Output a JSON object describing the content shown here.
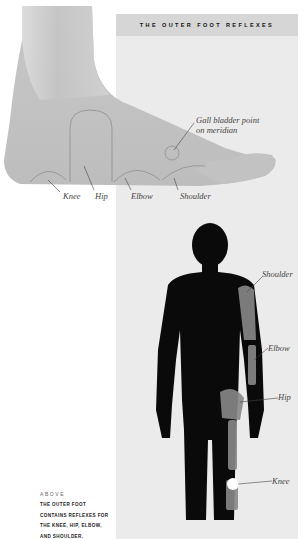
{
  "header": {
    "title": "THE OUTER FOOT REFLEXES"
  },
  "foot_labels": {
    "gall_bladder_line1": "Gall bladder point",
    "gall_bladder_line2": "on meridian",
    "knee": "Knee",
    "hip": "Hip",
    "elbow": "Elbow",
    "shoulder": "Shoulder"
  },
  "body_labels": {
    "shoulder": "Shoulder",
    "elbow": "Elbow",
    "hip": "Hip",
    "knee": "Knee"
  },
  "caption": {
    "kicker": "ABOVE",
    "lines": [
      "THE OUTER FOOT",
      "CONTAINS REFLEXES FOR",
      "THE KNEE, HIP, ELBOW,",
      "AND SHOULDER."
    ]
  },
  "colors": {
    "panel": "#ebebeb",
    "title_bar": "#d6d6d6",
    "foot": "#c9c9c9",
    "silhouette": "#0a0a0a"
  }
}
